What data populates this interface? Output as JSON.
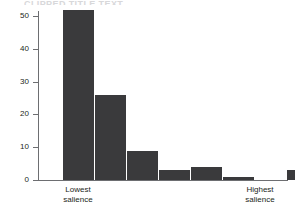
{
  "chart_data": {
    "type": "bar",
    "title": "",
    "xlabel": "",
    "ylabel": "",
    "categories": [
      "1",
      "2",
      "3",
      "4",
      "5",
      "6",
      "7",
      "8"
    ],
    "values": [
      52,
      26,
      9,
      3,
      4,
      1,
      0,
      3
    ],
    "ylim": [
      0,
      55
    ],
    "yticks": [
      0,
      10,
      20,
      30,
      40,
      50
    ],
    "ytick_labels": [
      "0",
      "10",
      "20",
      "30",
      "40",
      "50"
    ],
    "grid": false,
    "legend": false,
    "bar_color": "#3a3a3c",
    "axis_color": "#6d6e71",
    "category_endpoint_labels": {
      "low": "Lowest\nsalience",
      "high": "Highest\nsalience"
    }
  },
  "axis": {
    "y_tick_0": "0",
    "y_tick_1": "10",
    "y_tick_2": "20",
    "y_tick_3": "30",
    "y_tick_4": "40",
    "y_tick_5": "50"
  },
  "labels": {
    "lowest_line1": "Lowest",
    "lowest_line2": "salience",
    "highest_line1": "Highest",
    "highest_line2": "salience"
  },
  "title_remnant": "CLIPPED TITLE TEXT"
}
